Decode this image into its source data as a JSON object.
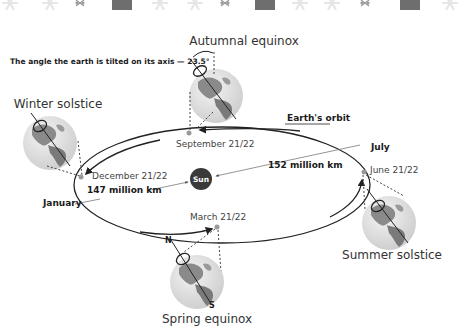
{
  "banner": {
    "decoration": [
      "snowflake-icon",
      "snowflake-icon",
      "snowflake-sprig-icon",
      "gift-icon",
      "snowflake-icon",
      "snowflake-icon",
      "snowflake-sprig-icon",
      "gift-icon",
      "snowflake-icon",
      "snowflake-icon",
      "snowflake-sprig-icon",
      "gift-icon",
      "snowflake-icon"
    ]
  },
  "diagram": {
    "tilt_label": "The angle the earth is tilted on its axis — 23.5°",
    "orbit_label": "Earth's orbit",
    "sun_label": "Sun",
    "distances": {
      "aphelion": "152 million km",
      "perihelion": "147 million km"
    },
    "months": {
      "aphelion_month": "July",
      "perihelion_month": "January"
    },
    "positions": [
      {
        "name": "Autumnal equinox",
        "date": "September 21/22"
      },
      {
        "name": "Winter solstice",
        "date": "December 21/22"
      },
      {
        "name": "Spring equinox",
        "date": "March 21/22"
      },
      {
        "name": "Summer solstice",
        "date": "June 21/22"
      }
    ],
    "poles": {
      "north": "N",
      "south": "S"
    }
  },
  "colors": {
    "sun": "#3a3a3a",
    "orbit": "#222222",
    "globe_ocean": "#e2e2e2",
    "globe_land": "#8a8a8a",
    "text": "#333333"
  }
}
